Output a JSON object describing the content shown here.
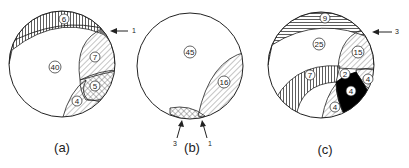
{
  "figure": {
    "panels": [
      {
        "id": "a",
        "caption": "(a)",
        "regions": [
          {
            "label": "6",
            "pattern": "vertical-lines"
          },
          {
            "label": "40",
            "pattern": "none"
          },
          {
            "label": "7",
            "pattern": "diagonal-lines"
          },
          {
            "label": "5",
            "pattern": "cross-hatch"
          },
          {
            "label": "4",
            "pattern": "diagonal-lines"
          }
        ],
        "arrows": [
          {
            "label": "1"
          }
        ]
      },
      {
        "id": "b",
        "caption": "(b)",
        "regions": [
          {
            "label": "45",
            "pattern": "none"
          },
          {
            "label": "16",
            "pattern": "diagonal-lines"
          }
        ],
        "arrows": [
          {
            "label": "3"
          },
          {
            "label": "1"
          }
        ]
      },
      {
        "id": "c",
        "caption": "(c)",
        "regions": [
          {
            "label": "9",
            "pattern": "horizontal-lines"
          },
          {
            "label": "25",
            "pattern": "none"
          },
          {
            "label": "15",
            "pattern": "diagonal-lines"
          },
          {
            "label": "7",
            "pattern": "vertical-lines"
          },
          {
            "label": "2",
            "pattern": "none"
          },
          {
            "label": "4",
            "pattern": "diagonal-lines"
          },
          {
            "label": "4",
            "pattern": "solid-black"
          },
          {
            "label": "4",
            "pattern": "diagonal-lines"
          }
        ],
        "arrows": [
          {
            "label": "3"
          }
        ]
      }
    ]
  }
}
